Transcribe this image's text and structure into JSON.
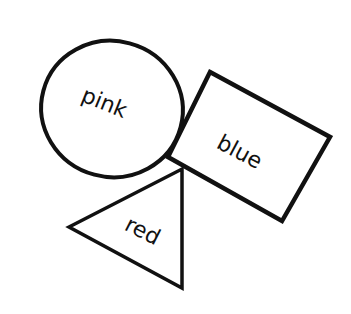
{
  "diagram": {
    "background": "#ffffff",
    "stroke_color": "#111111",
    "shapes": [
      {
        "type": "circle",
        "label": "pink",
        "center": [
          112,
          109
        ],
        "rx": 71,
        "ry": 68,
        "label_pos": [
          104,
          104
        ],
        "label_rotation": 22
      },
      {
        "type": "rectangle",
        "label": "blue",
        "points": "210,72 330,137 282,221 168,157",
        "label_pos": [
          239,
          153
        ],
        "label_rotation": 28
      },
      {
        "type": "triangle",
        "label": "red",
        "points": "69,227 182,169 182,288",
        "label_pos": [
          142,
          232
        ],
        "label_rotation": 27
      }
    ]
  }
}
